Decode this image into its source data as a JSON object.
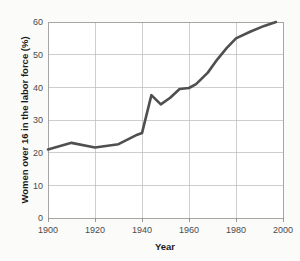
{
  "chart_data": {
    "type": "line",
    "title": "",
    "xlabel": "Year",
    "ylabel": "Women over 16 in the labor force (%)",
    "xlim": [
      1900,
      2000
    ],
    "ylim": [
      0,
      60
    ],
    "xticks": [
      1900,
      1920,
      1940,
      1960,
      1980,
      2000
    ],
    "xtick_labels": [
      "1900",
      "1920",
      "1940",
      "1960",
      "1980",
      "2000"
    ],
    "yticks": [
      0,
      10,
      20,
      30,
      40,
      50,
      60
    ],
    "ytick_labels": [
      "0",
      "10",
      "20",
      "30",
      "40",
      "50",
      "60"
    ],
    "grid": "horizontal-and-vertical",
    "legend": "none",
    "line_color": "#4f4f4f",
    "series": [
      {
        "name": "Women over 16 in the labor force (%)",
        "x": [
          1900,
          1910,
          1920,
          1930,
          1938,
          1940,
          1944,
          1948,
          1952,
          1956,
          1960,
          1963,
          1968,
          1972,
          1976,
          1980,
          1986,
          1992,
          1997
        ],
        "values": [
          21.0,
          23.0,
          21.6,
          22.6,
          25.5,
          26.0,
          37.6,
          34.8,
          36.8,
          39.5,
          39.8,
          41.0,
          44.5,
          48.5,
          52.0,
          55.0,
          57.0,
          58.8,
          60.0
        ]
      }
    ]
  }
}
